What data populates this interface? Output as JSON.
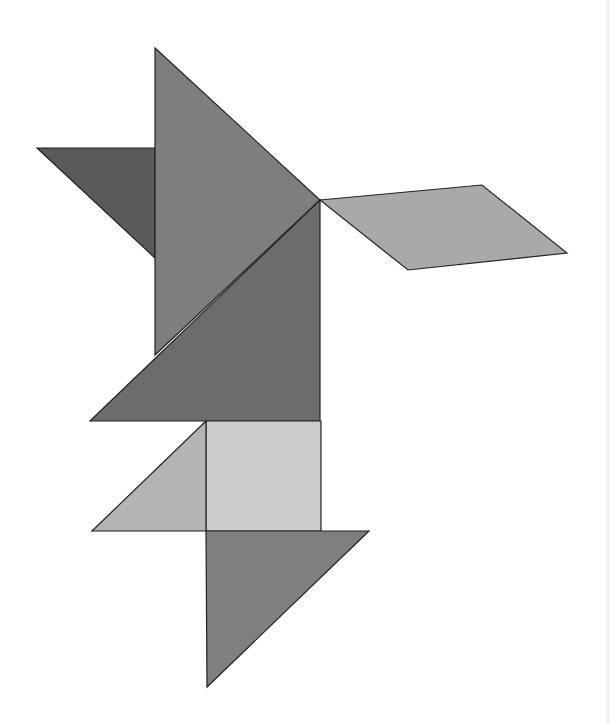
{
  "figure": {
    "type": "tangram",
    "background": "#ffffff",
    "pieces": [
      {
        "id": "dark-small-triangle",
        "shape": "triangle",
        "fill": "#5a5a5a",
        "points": "37,148 155,148 155,258"
      },
      {
        "id": "large-triangle-top",
        "shape": "triangle",
        "fill": "#7e7e7e",
        "points": "155,48 320,200 155,355"
      },
      {
        "id": "large-triangle-middle",
        "shape": "triangle",
        "fill": "#6c6c6c",
        "points": "320,200 320,421 90,421"
      },
      {
        "id": "parallelogram",
        "shape": "parallelogram",
        "fill": "#a9a9a9",
        "points": "320,200 482,185 567,253 408,270"
      },
      {
        "id": "square",
        "shape": "square",
        "fill": "#cdcdcd",
        "points": "206,421 321,421 321,531 206,531"
      },
      {
        "id": "small-triangle-left",
        "shape": "triangle",
        "fill": "#b4b4b4",
        "points": "206,421 206,531 92,531"
      },
      {
        "id": "medium-triangle-bottom",
        "shape": "triangle",
        "fill": "#7f7f7f",
        "points": "206,531 369,531 207,687"
      }
    ]
  }
}
